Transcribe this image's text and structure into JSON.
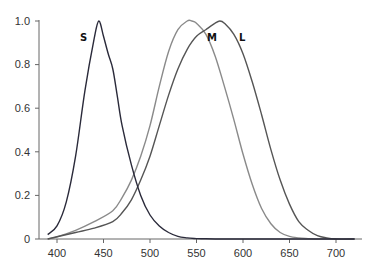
{
  "chart_data": {
    "type": "line",
    "title": "",
    "xlabel": "",
    "ylabel": "",
    "xlim": [
      390,
      720
    ],
    "ylim": [
      0,
      1.0
    ],
    "grid": false,
    "legend": "inline labels",
    "x_ticks": [
      "400",
      "450",
      "500",
      "550",
      "600",
      "650",
      "700"
    ],
    "y_ticks": [
      "0",
      "0.2",
      "0.4",
      "0.6",
      "0.8",
      "1.0"
    ],
    "series": [
      {
        "name": "S",
        "color": "#2a2a3a",
        "x": [
          390,
          400,
          410,
          420,
          430,
          440,
          445,
          450,
          455,
          460,
          465,
          470,
          480,
          490,
          500,
          510,
          520,
          530,
          540,
          550,
          560,
          580,
          600,
          650,
          700,
          720
        ],
        "values": [
          0.02,
          0.06,
          0.17,
          0.38,
          0.68,
          0.92,
          1.0,
          0.93,
          0.85,
          0.78,
          0.65,
          0.52,
          0.34,
          0.2,
          0.11,
          0.06,
          0.03,
          0.012,
          0.005,
          0.002,
          0.001,
          0,
          0,
          0,
          0,
          0
        ]
      },
      {
        "name": "M",
        "color": "#8a8a8a",
        "x": [
          390,
          400,
          420,
          440,
          460,
          470,
          480,
          490,
          500,
          510,
          520,
          530,
          540,
          545,
          550,
          560,
          570,
          580,
          590,
          600,
          610,
          620,
          630,
          640,
          650,
          660,
          670,
          680,
          700
        ],
        "values": [
          0.0,
          0.01,
          0.04,
          0.08,
          0.13,
          0.19,
          0.27,
          0.38,
          0.52,
          0.7,
          0.86,
          0.96,
          1.0,
          1.0,
          0.99,
          0.94,
          0.84,
          0.7,
          0.55,
          0.39,
          0.25,
          0.14,
          0.07,
          0.03,
          0.012,
          0.005,
          0.002,
          0.0,
          0.0
        ]
      },
      {
        "name": "L",
        "color": "#555555",
        "x": [
          390,
          400,
          420,
          440,
          460,
          470,
          480,
          490,
          500,
          510,
          520,
          530,
          540,
          550,
          560,
          570,
          575,
          580,
          590,
          600,
          610,
          620,
          630,
          640,
          650,
          660,
          670,
          680,
          690,
          700,
          720
        ],
        "values": [
          0.0,
          0.01,
          0.03,
          0.05,
          0.08,
          0.12,
          0.18,
          0.27,
          0.38,
          0.52,
          0.66,
          0.78,
          0.87,
          0.93,
          0.96,
          0.99,
          1.0,
          0.99,
          0.94,
          0.85,
          0.72,
          0.57,
          0.41,
          0.27,
          0.16,
          0.08,
          0.04,
          0.015,
          0.005,
          0.0,
          0.0
        ]
      }
    ],
    "annotations": [
      {
        "text": "S",
        "x": 422,
        "y": 0.93
      },
      {
        "text": "M",
        "x": 565,
        "y": 0.93
      },
      {
        "text": "L",
        "x": 593,
        "y": 0.93
      }
    ]
  },
  "axes": {
    "x_tick_labels": [
      "400",
      "450",
      "500",
      "550",
      "600",
      "650",
      "700"
    ],
    "y_tick_labels": [
      "0",
      "0.2",
      "0.4",
      "0.6",
      "0.8",
      "1.0"
    ]
  },
  "labels": {
    "s": "S",
    "m": "M",
    "l": "L"
  }
}
